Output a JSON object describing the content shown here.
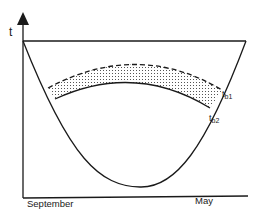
{
  "diagram": {
    "y_axis_label": "t",
    "x_axis_labels": {
      "start": "September",
      "end": "May"
    },
    "curve_labels": {
      "upper": "t",
      "upper_sub": "b1",
      "lower": "t",
      "lower_sub": "b2"
    },
    "elements": [
      "vertical time axis with arrow",
      "horizontal baseline axis",
      "top horizontal reference line",
      "parabolic curve",
      "dashed upper boundary curve (tb1)",
      "solid lower boundary curve (tb2)",
      "dotted shaded band between boundaries"
    ],
    "colors": {
      "line": "#1a1a1a",
      "background": "#ffffff",
      "dots": "#555555"
    }
  }
}
